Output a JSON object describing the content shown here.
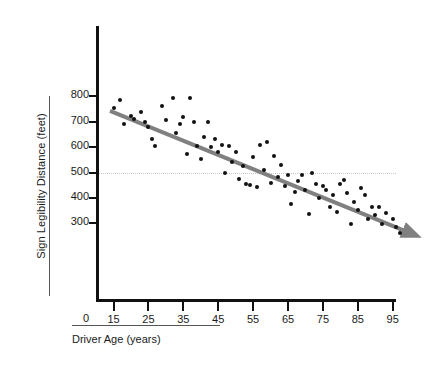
{
  "chart_data": {
    "type": "scatter",
    "title": "",
    "xlabel": "Driver Age (years)",
    "ylabel": "Sign Legibility Distance (feet)",
    "xlim": [
      10,
      100
    ],
    "ylim": [
      250,
      830
    ],
    "xticks": [
      15,
      25,
      35,
      45,
      55,
      65,
      75,
      85,
      95
    ],
    "xtick_labels": [
      "15",
      "25",
      "35",
      "45",
      "55",
      "65",
      "75",
      "85",
      "95"
    ],
    "yticks": [
      300,
      400,
      500,
      600,
      700,
      800
    ],
    "ytick_labels": [
      "300",
      "400",
      "500",
      "600",
      "700",
      "800"
    ],
    "y_origin_label": "0",
    "grid": false,
    "legend": null,
    "point_color": "#111111",
    "trendline": {
      "color": "#808080",
      "style": "solid-with-arrow",
      "x_start": 14,
      "y_start": 742,
      "x_end": 99,
      "y_end": 268
    },
    "reference_line": {
      "orientation": "horizontal",
      "y": 500,
      "style": "dotted",
      "color": "#c9c9c9"
    },
    "points": [
      [
        15,
        752
      ],
      [
        17,
        783
      ],
      [
        18,
        692
      ],
      [
        20,
        722
      ],
      [
        21,
        712
      ],
      [
        23,
        736
      ],
      [
        24,
        700
      ],
      [
        25,
        677
      ],
      [
        26,
        632
      ],
      [
        27,
        604
      ],
      [
        29,
        763
      ],
      [
        30,
        706
      ],
      [
        32,
        792
      ],
      [
        33,
        655
      ],
      [
        34,
        690
      ],
      [
        35,
        720
      ],
      [
        36,
        571
      ],
      [
        37,
        793
      ],
      [
        38,
        698
      ],
      [
        39,
        604
      ],
      [
        40,
        552
      ],
      [
        41,
        641
      ],
      [
        42,
        700
      ],
      [
        43,
        601
      ],
      [
        44,
        633
      ],
      [
        45,
        580
      ],
      [
        46,
        607
      ],
      [
        47,
        498
      ],
      [
        48,
        604
      ],
      [
        49,
        540
      ],
      [
        50,
        580
      ],
      [
        51,
        474
      ],
      [
        52,
        525
      ],
      [
        53,
        455
      ],
      [
        54,
        452
      ],
      [
        55,
        560
      ],
      [
        56,
        443
      ],
      [
        57,
        608
      ],
      [
        58,
        511
      ],
      [
        59,
        619
      ],
      [
        60,
        457
      ],
      [
        61,
        566
      ],
      [
        62,
        482
      ],
      [
        63,
        528
      ],
      [
        64,
        448
      ],
      [
        65,
        489
      ],
      [
        66,
        375
      ],
      [
        67,
        423
      ],
      [
        68,
        465
      ],
      [
        69,
        490
      ],
      [
        70,
        430
      ],
      [
        71,
        337
      ],
      [
        72,
        500
      ],
      [
        73,
        455
      ],
      [
        74,
        398
      ],
      [
        75,
        447
      ],
      [
        76,
        433
      ],
      [
        77,
        366
      ],
      [
        78,
        412
      ],
      [
        79,
        345
      ],
      [
        80,
        456
      ],
      [
        81,
        472
      ],
      [
        82,
        420
      ],
      [
        83,
        298
      ],
      [
        84,
        384
      ],
      [
        85,
        352
      ],
      [
        86,
        440
      ],
      [
        87,
        410
      ],
      [
        88,
        318
      ],
      [
        89,
        366
      ],
      [
        90,
        333
      ],
      [
        91,
        365
      ],
      [
        92,
        297
      ],
      [
        93,
        340
      ],
      [
        95,
        318
      ],
      [
        96,
        286
      ],
      [
        97,
        262
      ]
    ]
  }
}
